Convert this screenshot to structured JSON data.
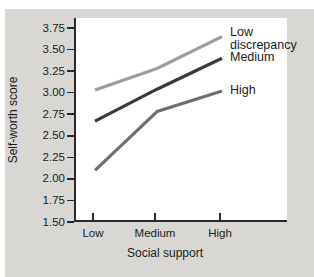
{
  "chart": {
    "panel_bg": "#d8d7d4",
    "plot_bg": "#ffffff",
    "axis_color": "#2a2a2a",
    "text_color": "#1c1c1c"
  },
  "chart_data": {
    "type": "line",
    "categories": [
      "Low",
      "Medium",
      "High"
    ],
    "series": [
      {
        "name": "Low discrepancy",
        "values": [
          3.03,
          3.28,
          3.65
        ],
        "color": "#9d9d9d"
      },
      {
        "name": "Medium",
        "values": [
          2.67,
          3.04,
          3.4
        ],
        "color": "#3b3b3b"
      },
      {
        "name": "High",
        "values": [
          2.1,
          2.78,
          3.02
        ],
        "color": "#6f6f6f"
      }
    ],
    "title": "",
    "xlabel": "Social support",
    "ylabel": "Self-worth score",
    "ylim": [
      1.5,
      3.75
    ],
    "ytick_step": 0.25,
    "ytick_labels": [
      "1.50",
      "1.75",
      "2.00",
      "2.25",
      "2.50",
      "2.75",
      "3.00",
      "3.25",
      "3.50",
      "3.75"
    ],
    "grid": false,
    "legend_position": "right-of-line-ends"
  }
}
